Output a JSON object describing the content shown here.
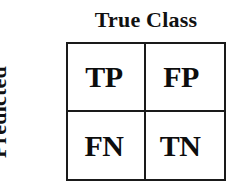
{
  "figure": {
    "background_color": "#ffffff",
    "border_color": "#1a1a1a",
    "text_color": "#0d0d0d"
  },
  "axes": {
    "column_axis_title": "True Class",
    "row_axis_title_line1": "Predicted",
    "row_axis_title_line2": "Class"
  },
  "matrix": {
    "rows": 2,
    "columns": 2,
    "cells": [
      {
        "id": "tp",
        "label": "TP",
        "row": 0,
        "column": 0
      },
      {
        "id": "fp",
        "label": "FP",
        "row": 0,
        "column": 1
      },
      {
        "id": "fn",
        "label": "FN",
        "row": 1,
        "column": 0
      },
      {
        "id": "tn",
        "label": "TN",
        "row": 1,
        "column": 1
      }
    ]
  }
}
